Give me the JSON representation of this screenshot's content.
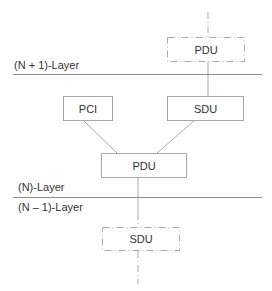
{
  "diagram": {
    "title": "",
    "layers": [
      {
        "id": "n_plus_1",
        "label": "(N + 1)-Layer"
      },
      {
        "id": "n",
        "label": "(N)-Layer"
      },
      {
        "id": "n_minus_1",
        "label": "(N – 1)-Layer"
      }
    ],
    "nodes": {
      "top_pdu": {
        "label": "PDU",
        "style": "dash-dot",
        "layer": "(N + 1)-Layer"
      },
      "pci": {
        "label": "PCI",
        "style": "solid",
        "layer": "(N)-Layer"
      },
      "sdu": {
        "label": "SDU",
        "style": "solid",
        "layer": "(N)-Layer"
      },
      "mid_pdu": {
        "label": "PDU",
        "style": "solid",
        "layer": "(N)-Layer"
      },
      "bottom_sdu": {
        "label": "SDU",
        "style": "dash-dot",
        "layer": "(N – 1)-Layer"
      }
    },
    "edges": [
      {
        "from": "above",
        "to": "top_pdu",
        "style": "dash-dot"
      },
      {
        "from": "top_pdu",
        "to": "sdu",
        "style": "solid"
      },
      {
        "from": "pci",
        "to": "mid_pdu",
        "style": "solid"
      },
      {
        "from": "sdu",
        "to": "mid_pdu",
        "style": "solid"
      },
      {
        "from": "mid_pdu",
        "to": "bottom_sdu",
        "style": "solid"
      },
      {
        "from": "bottom_sdu",
        "to": "below",
        "style": "dash-dot"
      }
    ],
    "colors": {
      "line": "#a9a9a9",
      "layer_line": "#8c8c8c",
      "text": "#333333"
    }
  }
}
